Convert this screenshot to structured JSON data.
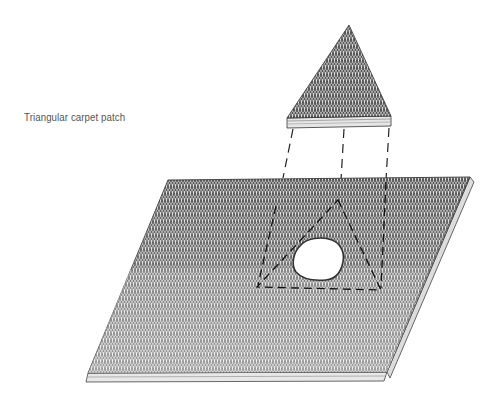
{
  "diagram": {
    "labels": {
      "patch_label": "Triangular carpet patch"
    },
    "elements": {
      "patch": {
        "shape": "triangle",
        "apex": [
          349,
          25
        ],
        "base_left": [
          287,
          117
        ],
        "base_right": [
          391,
          116
        ]
      },
      "carpet": {
        "shape": "parallelogram",
        "corners": [
          [
            168,
            180
          ],
          [
            470,
            177
          ],
          [
            387,
            372
          ],
          [
            88,
            373
          ]
        ]
      },
      "cutout_outline": {
        "shape": "dashed-triangle",
        "apex": [
          338,
          200
        ],
        "base_left": [
          257,
          287
        ],
        "base_right": [
          381,
          290
        ]
      },
      "hole": {
        "shape": "irregular",
        "center": [
          318,
          259
        ]
      }
    },
    "colors": {
      "pile_dark": "#5a5a5a",
      "pile_mid": "#8c8c8c",
      "pile_light": "#cfcfcf",
      "backing": "#e8e8e8",
      "line": "#222222",
      "label": "#555555"
    }
  }
}
